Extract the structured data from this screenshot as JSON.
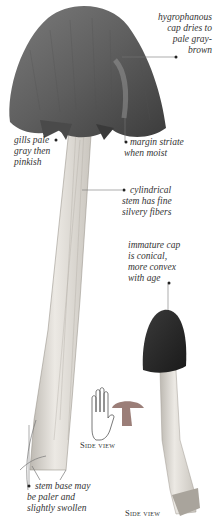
{
  "annotations": {
    "cap_hygrophanous": "hygrophanous cap dries to pale gray-brown",
    "cap_hygrophanous_lines": [
      "hygrophanous",
      "cap dries to",
      "pale gray-",
      "brown"
    ],
    "gills_lines": [
      "gills pale",
      "gray then",
      "pinkish"
    ],
    "margin_lines": [
      "margin striate",
      "when moist"
    ],
    "stem_lines": [
      "cylindrical",
      "stem has fine",
      "silvery fibers"
    ],
    "immature_lines": [
      "immature cap",
      "is conical,",
      "more convex",
      "with age"
    ],
    "stem_base_lines": [
      "stem base may",
      "be paler and",
      "slightly swollen"
    ]
  },
  "captions": {
    "side_view_left": "Side view",
    "side_view_right": "Side view"
  },
  "icons": {
    "scale": "hand-and-mushroom-scale-icon"
  },
  "colors": {
    "cap_dark": "#3f3f3f",
    "cap_mid": "#6a6a6a",
    "stem": "#e4e1dc",
    "scale_mushroom": "#9b7e78",
    "leader_line": "#666666"
  }
}
